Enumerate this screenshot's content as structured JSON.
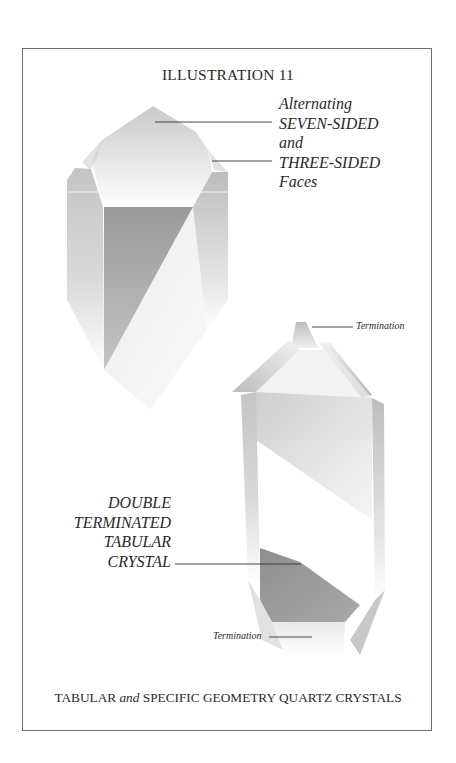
{
  "illustration": {
    "title": "ILLUSTRATION 11",
    "callout_top": {
      "lines": [
        "Alternating",
        "SEVEN-SIDED",
        "and",
        "THREE-SIDED",
        "Faces"
      ]
    },
    "callout_termination_top": "Termination",
    "callout_double": {
      "lines": [
        "DOUBLE",
        "TERMINATED",
        "TABULAR",
        "CRYSTAL"
      ]
    },
    "callout_termination_bottom": "Termination",
    "caption": {
      "part1": "TABULAR",
      "part2": "and",
      "part3": "SPECIFIC GEOMETRY QUARTZ CRYSTALS"
    }
  },
  "colors": {
    "frame": "#6e6e6e",
    "leader_line": "#333333",
    "face_dark": "#8c8c8c",
    "face_mid": "#b9b9b9",
    "face_light": "#dcdcdc"
  }
}
